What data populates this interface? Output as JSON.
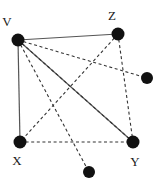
{
  "figure": {
    "name": "undirected-graph-diagram",
    "width": 162,
    "height": 192,
    "background_color": "#ffffff"
  },
  "style": {
    "node_color": "#111111",
    "node_radius": 6,
    "solid_edge_color": "#555555",
    "dashed_edge_color": "#333333",
    "solid_edge_width": 1.2,
    "dashed_edge_width": 1.1,
    "dash_pattern": "3,2.6",
    "label_color": "#1a1a1a",
    "label_font_size": 13
  },
  "graph": {
    "nodes": [
      {
        "id": "V",
        "label": "V",
        "x": 18,
        "y": 40,
        "r": 6.5,
        "label_x": 7,
        "label_y": 21,
        "labeled": true
      },
      {
        "id": "Z",
        "label": "Z",
        "x": 118,
        "y": 34,
        "r": 6.5,
        "label_x": 112,
        "label_y": 15,
        "labeled": true
      },
      {
        "id": "N1",
        "label": "",
        "x": 147,
        "y": 78,
        "r": 6.0,
        "label_x": 0,
        "label_y": 0,
        "labeled": false
      },
      {
        "id": "X",
        "label": "X",
        "x": 20,
        "y": 142,
        "r": 6.5,
        "label_x": 17,
        "label_y": 160,
        "labeled": true
      },
      {
        "id": "Y",
        "label": "Y",
        "x": 133,
        "y": 142,
        "r": 6.5,
        "label_x": 135,
        "label_y": 161,
        "labeled": true
      },
      {
        "id": "N2",
        "label": "",
        "x": 89,
        "y": 172,
        "r": 6.0,
        "label_x": 0,
        "label_y": 0,
        "labeled": false
      }
    ],
    "edges": [
      {
        "from": "V",
        "to": "Z",
        "style": "solid"
      },
      {
        "from": "V",
        "to": "X",
        "style": "solid"
      },
      {
        "from": "V",
        "to": "Y",
        "style": "solid"
      },
      {
        "from": "V",
        "to": "N1",
        "style": "dashed"
      },
      {
        "from": "V",
        "to": "N2",
        "style": "dashed"
      },
      {
        "from": "V",
        "to": "Y",
        "style": "dashed"
      },
      {
        "from": "Z",
        "to": "X",
        "style": "dashed"
      },
      {
        "from": "Z",
        "to": "Y",
        "style": "dashed"
      },
      {
        "from": "X",
        "to": "Y",
        "style": "dashed"
      }
    ]
  }
}
